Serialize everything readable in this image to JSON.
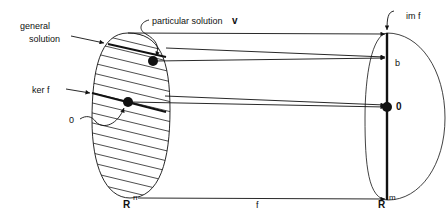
{
  "labels": {
    "general_solution_line1": "general",
    "general_solution_line2": "solution",
    "particular_solution": "particular solution",
    "particular_solution_symbol": "v",
    "kernel": "ker  f",
    "zero_domain": "0",
    "image": "im  f",
    "b": "b",
    "zero_codomain": "0",
    "domain_space": "R",
    "domain_exponent": "n",
    "codomain_space": "R",
    "codomain_exponent": "m",
    "map": "f"
  },
  "colors": {
    "ink": "#111111",
    "background": "#ffffff"
  }
}
